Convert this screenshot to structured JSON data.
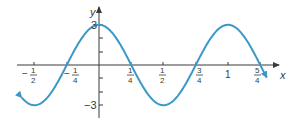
{
  "chart_data": {
    "type": "line",
    "title": "",
    "xlabel": "x",
    "ylabel": "y",
    "function": "y = 3cos(2πx)",
    "xlim": [
      -0.6,
      1.3
    ],
    "ylim": [
      -3,
      3
    ],
    "grid": false,
    "legend": null,
    "x_ticks": [
      {
        "value": -0.5,
        "num": "1",
        "den": "2",
        "neg": true
      },
      {
        "value": -0.25,
        "num": "1",
        "den": "4",
        "neg": true
      },
      {
        "value": 0.25,
        "num": "1",
        "den": "4",
        "neg": false
      },
      {
        "value": 0.5,
        "num": "1",
        "den": "2",
        "neg": false
      },
      {
        "value": 0.75,
        "num": "3",
        "den": "4",
        "neg": false
      },
      {
        "value": 1,
        "label": "1"
      },
      {
        "value": 1.25,
        "num": "5",
        "den": "4",
        "neg": false
      }
    ],
    "y_ticks": [
      -3,
      -2,
      -1,
      1,
      2,
      3
    ],
    "y_tick_labels": {
      "top": "3",
      "bottom": "−3"
    },
    "series": [
      {
        "name": "y = 3cos(2πx)",
        "color": "#3a97c9",
        "x": [
          -0.6,
          -0.5,
          -0.25,
          0,
          0.25,
          0.5,
          0.75,
          1,
          1.25,
          1.3
        ],
        "y": [
          -2.43,
          -3,
          0,
          3,
          0,
          -3,
          0,
          3,
          0,
          -0.93
        ]
      }
    ]
  },
  "labels": {
    "x_axis": "x",
    "y_axis": "y",
    "y_top": "3",
    "y_bottom": "−3",
    "minus": "−",
    "one": "1"
  },
  "colors": {
    "curve": "#3a97c9",
    "axis": "#3a3a3a"
  }
}
